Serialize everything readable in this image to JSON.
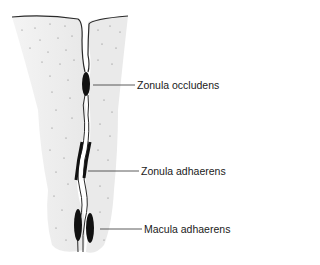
{
  "diagram": {
    "type": "cell-junction-illustration",
    "colors": {
      "cytoplasm": "#ececec",
      "outline": "#2a2a2a",
      "junction": "#111111",
      "leader_line": "#333333",
      "background": "#ffffff"
    },
    "labels": [
      {
        "id": "zonula-occludens",
        "text": "Zonula occludens",
        "x": 137,
        "y": 79,
        "leader_from_x": 93,
        "leader_y": 85
      },
      {
        "id": "zonula-adhaerens",
        "text": "Zonula adhaerens",
        "x": 141,
        "y": 165,
        "leader_from_x": 88,
        "leader_y": 171
      },
      {
        "id": "macula-adhaerens",
        "text": "Macula adhaerens",
        "x": 144,
        "y": 223,
        "leader_from_x": 100,
        "leader_y": 229
      }
    ]
  }
}
